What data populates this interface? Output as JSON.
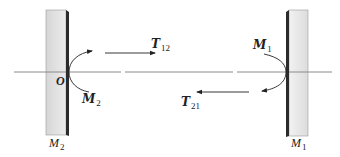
{
  "diagram": {
    "colors": {
      "axis": "#8a8a8a",
      "mirror_face": "#e2e2e2",
      "mirror_edge": "#2b2b2b",
      "arrows": "#222222",
      "text": "#222222"
    },
    "origin": {
      "label": "O"
    },
    "mirrors": [
      {
        "id": "left",
        "label_main": "M",
        "label_sub": "2"
      },
      {
        "id": "right",
        "label_main": "M",
        "label_sub": "1"
      }
    ],
    "moments": [
      {
        "id": "left",
        "label_main": "M",
        "label_sub": "2"
      },
      {
        "id": "right",
        "label_main": "M",
        "label_sub": "1"
      }
    ],
    "transfers": [
      {
        "id": "forward",
        "direction": "right",
        "label_main": "T",
        "label_sub": "12"
      },
      {
        "id": "backward",
        "direction": "left",
        "label_main": "T",
        "label_sub": "21"
      }
    ]
  }
}
